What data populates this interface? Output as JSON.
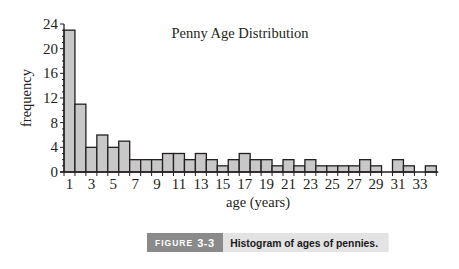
{
  "chart_data": {
    "type": "bar",
    "title": "Penny Age Distribution",
    "xlabel": "age (years)",
    "ylabel": "frequency",
    "categories": [
      1,
      2,
      3,
      4,
      5,
      6,
      7,
      8,
      9,
      10,
      11,
      12,
      13,
      14,
      15,
      16,
      17,
      18,
      19,
      20,
      21,
      22,
      23,
      24,
      25,
      26,
      27,
      28,
      29,
      30,
      31,
      32,
      33,
      34
    ],
    "values": [
      23,
      11,
      4,
      6,
      4,
      5,
      2,
      2,
      2,
      3,
      3,
      2,
      3,
      2,
      1,
      2,
      3,
      2,
      2,
      1,
      2,
      1,
      2,
      1,
      1,
      1,
      1,
      2,
      1,
      0,
      2,
      1,
      0,
      1
    ],
    "x_tick_labels": [
      "1",
      "3",
      "5",
      "7",
      "9",
      "11",
      "13",
      "15",
      "17",
      "19",
      "21",
      "23",
      "25",
      "27",
      "29",
      "31",
      "33"
    ],
    "y_tick_labels": [
      "0",
      "4",
      "8",
      "12",
      "16",
      "20",
      "24"
    ],
    "ylim": [
      0,
      24
    ],
    "grid": false,
    "legend": null,
    "bar_fill": "#c8c8c8",
    "bar_edge": "#231f20"
  },
  "caption": {
    "figure_prefix": "FIGURE",
    "figure_number": "3-3",
    "text": "Histogram of ages of pennies."
  }
}
